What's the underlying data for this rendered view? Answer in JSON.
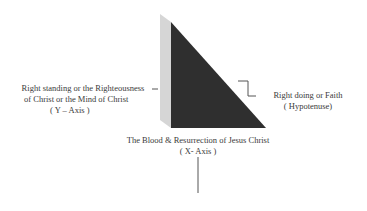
{
  "diagram": {
    "y_axis": {
      "line1": "Right standing or the Righteousness",
      "line2": "of Christ or the Mind of Christ",
      "line3": "( Y – Axis )"
    },
    "hypotenuse": {
      "line1": "Right doing or Faith",
      "line2": "( Hypotenuse)"
    },
    "x_axis": {
      "line1": "The Blood & Resurrection of Jesus Christ",
      "line2": "( X- Axis )"
    },
    "colors": {
      "triangle": "#2e2e2e",
      "side": "#d4d4d4",
      "lines": "#555555"
    }
  }
}
